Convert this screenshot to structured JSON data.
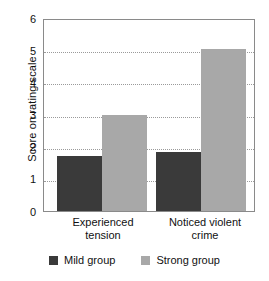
{
  "chart_data": {
    "type": "bar",
    "title": "",
    "xlabel": "",
    "ylabel": "Score on rating scale",
    "categories": [
      "Experienced tension",
      "Noticed violent crime"
    ],
    "category_lines": [
      [
        "Experienced",
        "tension"
      ],
      [
        "Noticed violent",
        "crime"
      ]
    ],
    "series": [
      {
        "name": "Mild group",
        "color": "#3a3a3a",
        "values": [
          1.7,
          1.85
        ]
      },
      {
        "name": "Strong group",
        "color": "#a8a8a8",
        "values": [
          3.0,
          5.05
        ]
      }
    ],
    "ylim": [
      0,
      6
    ],
    "yticks": [
      0,
      1,
      2,
      3,
      4,
      5,
      6
    ],
    "ytick_labels": [
      "0",
      "1",
      "2",
      "3",
      "4",
      "5",
      "6"
    ],
    "grid": true,
    "grid_axis": "y",
    "legend_position": "bottom"
  },
  "legend": {
    "items": [
      {
        "label": "Mild group",
        "color": "#3a3a3a"
      },
      {
        "label": "Strong group",
        "color": "#a8a8a8"
      }
    ]
  },
  "axis": {
    "y_title": "Score on rating scale"
  }
}
